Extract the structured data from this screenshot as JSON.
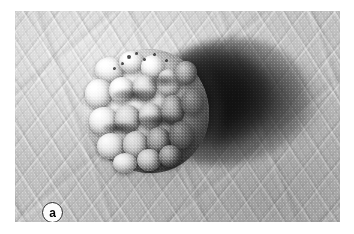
{
  "figure": {
    "panel_label": "a",
    "caption_text": "",
    "color_mode": "grayscale",
    "background_color": "#ffffff"
  },
  "photo": {
    "alt_description": "Grayscale clinical close-up photograph of a verrucous nodular skin lesion with cauliflower-like lobules on wrinkled skin, casting a dark shadow to the right",
    "frame": {
      "left": 15,
      "top": 11,
      "width": 325,
      "height": 211
    },
    "tones": {
      "skin_light": "#dcdcdc",
      "skin_mid": "#c2c2c2",
      "skin_dark": "#b0b0b0",
      "lesion_highlight": "#fbfbfb",
      "lesion_mid": "#ababab",
      "lesion_shadow": "#2a2a2a",
      "cast_shadow": "#0a0a0a"
    }
  },
  "regions": {
    "lesion": {
      "name": "verrucous-nodule",
      "left": 68,
      "top": 38,
      "width": 126,
      "height": 124
    },
    "cast_shadow": {
      "name": "cast-shadow",
      "left": 128,
      "top": 28,
      "width": 166,
      "height": 126
    },
    "skin_field": {
      "name": "surrounding-skin",
      "texture": "rhomboid glyphic lines"
    }
  },
  "lobules": [
    {
      "left": 12,
      "top": 8,
      "w": 30,
      "h": 26,
      "tone": "light"
    },
    {
      "left": 36,
      "top": 2,
      "w": 26,
      "h": 22,
      "tone": "light"
    },
    {
      "left": 58,
      "top": 6,
      "w": 24,
      "h": 24,
      "tone": "light"
    },
    {
      "left": 2,
      "top": 30,
      "w": 28,
      "h": 30,
      "tone": "light"
    },
    {
      "left": 26,
      "top": 28,
      "w": 26,
      "h": 26,
      "tone": "light"
    },
    {
      "left": 50,
      "top": 26,
      "w": 24,
      "h": 26,
      "tone": "mid"
    },
    {
      "left": 74,
      "top": 20,
      "w": 24,
      "h": 28,
      "tone": "mid"
    },
    {
      "left": 92,
      "top": 12,
      "w": 22,
      "h": 24,
      "tone": "dark"
    },
    {
      "left": 6,
      "top": 58,
      "w": 30,
      "h": 28,
      "tone": "light"
    },
    {
      "left": 32,
      "top": 56,
      "w": 26,
      "h": 28,
      "tone": "mid"
    },
    {
      "left": 56,
      "top": 54,
      "w": 24,
      "h": 26,
      "tone": "mid"
    },
    {
      "left": 78,
      "top": 46,
      "w": 24,
      "h": 30,
      "tone": "dark"
    },
    {
      "left": 98,
      "top": 40,
      "w": 22,
      "h": 26,
      "tone": "shade"
    },
    {
      "left": 14,
      "top": 84,
      "w": 28,
      "h": 26,
      "tone": "light"
    },
    {
      "left": 40,
      "top": 82,
      "w": 26,
      "h": 28,
      "tone": "mid"
    },
    {
      "left": 64,
      "top": 78,
      "w": 24,
      "h": 28,
      "tone": "dark"
    },
    {
      "left": 86,
      "top": 72,
      "w": 24,
      "h": 28,
      "tone": "shade"
    },
    {
      "left": 30,
      "top": 104,
      "w": 24,
      "h": 20,
      "tone": "light"
    },
    {
      "left": 54,
      "top": 100,
      "w": 24,
      "h": 22,
      "tone": "mid"
    },
    {
      "left": 76,
      "top": 96,
      "w": 22,
      "h": 22,
      "tone": "dark"
    }
  ],
  "specks": [
    {
      "left": 44,
      "top": 6,
      "d": 4
    },
    {
      "left": 52,
      "top": 3,
      "d": 3
    },
    {
      "left": 60,
      "top": 9,
      "d": 3
    },
    {
      "left": 38,
      "top": 13,
      "w": 3
    },
    {
      "left": 70,
      "top": 4,
      "d": 3
    },
    {
      "left": 30,
      "top": 18,
      "d": 3
    },
    {
      "left": 82,
      "top": 10,
      "d": 3
    }
  ]
}
